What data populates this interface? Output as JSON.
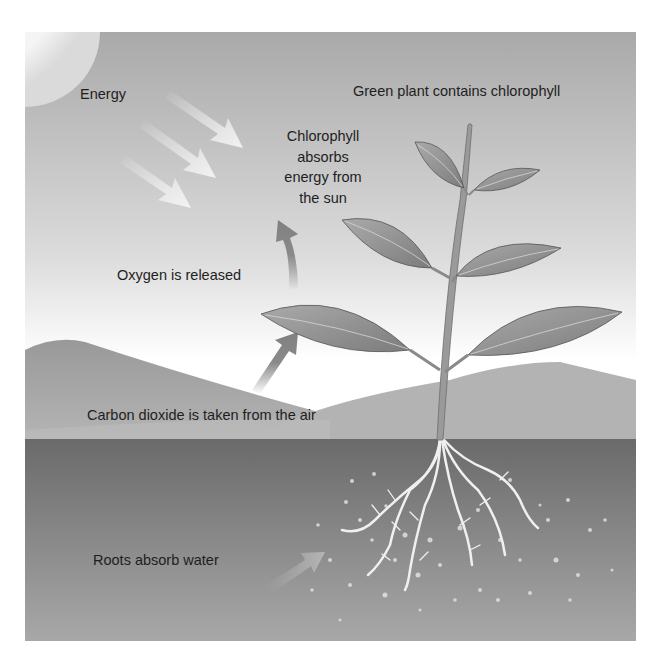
{
  "diagram": {
    "labels": {
      "energy": "Energy",
      "green_plant": "Green plant contains chlorophyll",
      "chlorophyll_absorbs": "Chlorophyll\nabsorbs\nenergy from\nthe sun",
      "oxygen": "Oxygen is released",
      "carbon_dioxide": "Carbon dioxide is taken from the air",
      "roots": "Roots absorb water"
    },
    "colors": {
      "sky_top": "#a9a9a9",
      "sky_bottom": "#ffffff",
      "hill": "#a6a6a6",
      "soil_top": "#6f6f6f",
      "soil_bottom": "#a5a5a5",
      "leaf": "#8c8c8c",
      "arrow": "#8a8a8a",
      "root": "#f2f2f2"
    }
  }
}
